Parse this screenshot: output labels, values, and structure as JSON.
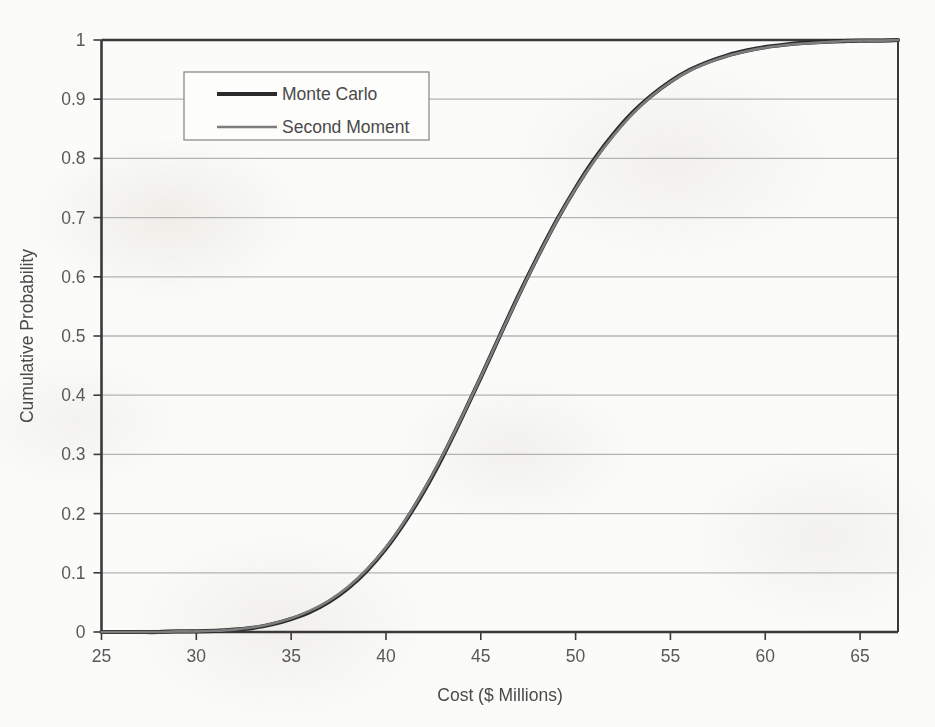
{
  "chart_data": {
    "type": "line",
    "title": "",
    "xlabel": "Cost  ($ Millions)",
    "ylabel": "Cumulative Probability",
    "xlim": [
      25,
      67
    ],
    "ylim": [
      0,
      1
    ],
    "xticks": [
      25,
      30,
      35,
      40,
      45,
      50,
      55,
      60,
      65
    ],
    "xtick_labels": [
      "25",
      "30",
      "35",
      "40",
      "45",
      "50",
      "55",
      "60",
      "65"
    ],
    "yticks": [
      0,
      0.1,
      0.2,
      0.3,
      0.4,
      0.5,
      0.6,
      0.7,
      0.8,
      0.9,
      1
    ],
    "ytick_labels": [
      "0",
      "0.1",
      "0.2",
      "0.3",
      "0.4",
      "0.5",
      "0.6",
      "0.7",
      "0.8",
      "0.9",
      "1"
    ],
    "grid": "horizontal",
    "legend_position": "upper-left-inside",
    "series": [
      {
        "name": "Monte Carlo",
        "color": "#2b2b2b",
        "width": 4.2,
        "x": [
          25,
          26,
          27,
          28,
          29,
          30,
          31,
          32,
          33,
          34,
          35,
          36,
          37,
          38,
          39,
          40,
          41,
          42,
          43,
          44,
          45,
          46,
          47,
          48,
          49,
          50,
          51,
          52,
          53,
          54,
          55,
          56,
          57,
          58,
          59,
          60,
          61,
          62,
          63,
          64,
          65,
          66,
          67
        ],
        "y": [
          0.0,
          0.0,
          0.0,
          0.0,
          0.001,
          0.001,
          0.002,
          0.004,
          0.007,
          0.013,
          0.022,
          0.034,
          0.051,
          0.074,
          0.104,
          0.141,
          0.186,
          0.238,
          0.297,
          0.362,
          0.43,
          0.5,
          0.569,
          0.634,
          0.695,
          0.75,
          0.799,
          0.841,
          0.877,
          0.906,
          0.93,
          0.949,
          0.963,
          0.974,
          0.982,
          0.988,
          0.992,
          0.995,
          0.997,
          0.998,
          0.999,
          0.999,
          1.0
        ]
      },
      {
        "name": "Second Moment",
        "color": "#7d7d7d",
        "width": 2.6,
        "x": [
          25,
          26,
          27,
          28,
          29,
          30,
          31,
          32,
          33,
          34,
          35,
          36,
          37,
          38,
          39,
          40,
          41,
          42,
          43,
          44,
          45,
          46,
          47,
          48,
          49,
          50,
          51,
          52,
          53,
          54,
          55,
          56,
          57,
          58,
          59,
          60,
          61,
          62,
          63,
          64,
          65,
          66,
          67
        ],
        "y": [
          0.0,
          0.0,
          0.0,
          0.0,
          0.001,
          0.001,
          0.002,
          0.004,
          0.008,
          0.014,
          0.023,
          0.036,
          0.053,
          0.076,
          0.106,
          0.143,
          0.188,
          0.24,
          0.299,
          0.363,
          0.431,
          0.5,
          0.568,
          0.633,
          0.694,
          0.749,
          0.797,
          0.839,
          0.875,
          0.905,
          0.929,
          0.948,
          0.962,
          0.973,
          0.981,
          0.987,
          0.991,
          0.994,
          0.996,
          0.998,
          0.999,
          0.999,
          1.0
        ]
      }
    ],
    "legend_entries": [
      {
        "label": "Monte Carlo",
        "color": "#2b2b2b",
        "width": 4.2
      },
      {
        "label": "Second Moment",
        "color": "#7d7d7d",
        "width": 2.6
      }
    ],
    "colors": {
      "background": "#fbfbf9",
      "gridline": "#b3b3b3",
      "axis": "#3a3a3a",
      "tick_text": "#595959",
      "legend_border": "#8c8c8c"
    }
  }
}
